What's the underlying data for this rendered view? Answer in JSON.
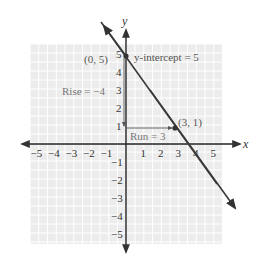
{
  "chart_data": {
    "type": "line",
    "title": "",
    "xlabel": "x",
    "ylabel": "y",
    "xlim": [
      -5,
      5
    ],
    "ylim": [
      -5,
      5
    ],
    "grid": true,
    "x_ticks": [
      "-5",
      "-4",
      "-3",
      "-2",
      "-1",
      "1",
      "2",
      "3",
      "4",
      "5"
    ],
    "y_ticks_positive": [
      "5",
      "4",
      "3",
      "2",
      "1"
    ],
    "y_ticks_negative": [
      "-1",
      "-2",
      "-3",
      "-4",
      "-5"
    ],
    "line": {
      "slope": -1.3333,
      "intercept": 5,
      "equation": "y = -4/3 x + 5"
    },
    "points": [
      {
        "label": "(0, 5)",
        "x": 0,
        "y": 5
      },
      {
        "label": "(3, 1)",
        "x": 3,
        "y": 1
      }
    ],
    "annotations": {
      "y_intercept": "y-intercept = 5",
      "rise": "Rise = −4",
      "run": "Run = 3"
    }
  },
  "colors": {
    "grid_bg": "#ececec",
    "grid_line": "#ffffff",
    "axis": "#222222",
    "line": "#3a3a3a",
    "label": "#333333",
    "annotation": "#555555"
  }
}
